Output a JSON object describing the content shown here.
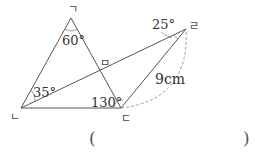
{
  "diagram": {
    "points": {
      "a": {
        "label": "ㄱ"
      },
      "b": {
        "label": "ㄴ"
      },
      "c": {
        "label": "ㄷ"
      },
      "d": {
        "label": "ㄹ"
      },
      "e": {
        "label": "ㅁ"
      }
    },
    "angles": {
      "at_a": "60°",
      "at_b": "35°",
      "at_c": "130°",
      "at_d": "25°"
    },
    "length": "9cm"
  },
  "answer": {
    "open": "(",
    "close": ")"
  }
}
